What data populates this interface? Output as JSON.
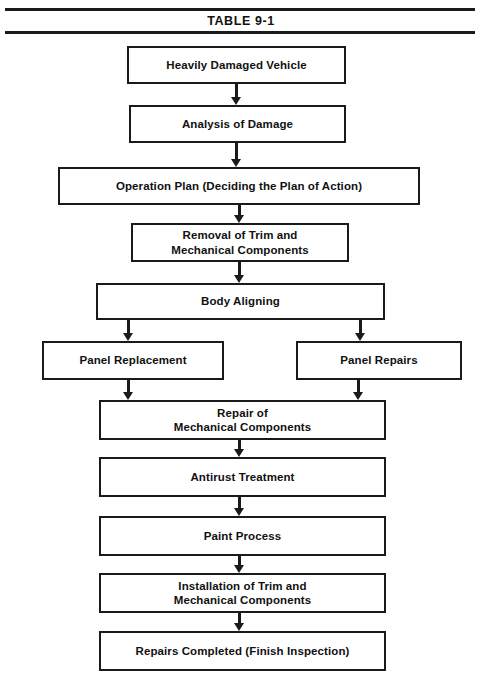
{
  "title": "TABLE 9-1",
  "colors": {
    "line": "#1a1a1a",
    "text": "#111111",
    "background": "#ffffff"
  },
  "diagram": {
    "type": "flowchart",
    "orientation": "top-to-bottom",
    "nodes": [
      {
        "id": "heavily-damaged-vehicle",
        "label": "Heavily Damaged Vehicle"
      },
      {
        "id": "analysis-of-damage",
        "label": "Analysis of Damage"
      },
      {
        "id": "operation-plan",
        "label": "Operation Plan (Deciding the Plan of Action)"
      },
      {
        "id": "removal-of-trim",
        "label": "Removal of Trim and\nMechanical Components"
      },
      {
        "id": "body-aligning",
        "label": "Body Aligning"
      },
      {
        "id": "panel-replacement",
        "label": "Panel Replacement"
      },
      {
        "id": "panel-repairs",
        "label": "Panel Repairs"
      },
      {
        "id": "repair-of-mechanical",
        "label": "Repair of\nMechanical Components"
      },
      {
        "id": "antirust-treatment",
        "label": "Antirust Treatment"
      },
      {
        "id": "paint-process",
        "label": "Paint Process"
      },
      {
        "id": "installation-of-trim",
        "label": "Installation of Trim and\nMechanical Components"
      },
      {
        "id": "repairs-completed",
        "label": "Repairs Completed (Finish Inspection)"
      }
    ],
    "edges": [
      {
        "from": "heavily-damaged-vehicle",
        "to": "analysis-of-damage"
      },
      {
        "from": "analysis-of-damage",
        "to": "operation-plan"
      },
      {
        "from": "operation-plan",
        "to": "removal-of-trim"
      },
      {
        "from": "removal-of-trim",
        "to": "body-aligning"
      },
      {
        "from": "body-aligning",
        "to": "panel-replacement"
      },
      {
        "from": "body-aligning",
        "to": "panel-repairs"
      },
      {
        "from": "panel-replacement",
        "to": "repair-of-mechanical"
      },
      {
        "from": "panel-repairs",
        "to": "repair-of-mechanical"
      },
      {
        "from": "repair-of-mechanical",
        "to": "antirust-treatment"
      },
      {
        "from": "antirust-treatment",
        "to": "paint-process"
      },
      {
        "from": "paint-process",
        "to": "installation-of-trim"
      },
      {
        "from": "installation-of-trim",
        "to": "repairs-completed"
      }
    ]
  }
}
